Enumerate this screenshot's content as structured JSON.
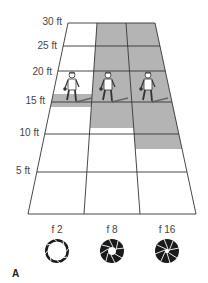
{
  "figure_label": "A",
  "distance_axis": {
    "unit": "ft",
    "labels": [
      "30 ft",
      "25 ft",
      "20 ft",
      "15 ft",
      "10 ft",
      "5 ft"
    ]
  },
  "columns": [
    {
      "aperture": "f 2",
      "focus_distance_ft": 15,
      "depth_of_field_ft": [
        14,
        16
      ],
      "iris": "wide-open"
    },
    {
      "aperture": "f 8",
      "focus_distance_ft": 15,
      "depth_of_field_ft": [
        12,
        30
      ],
      "iris": "medium"
    },
    {
      "aperture": "f 16",
      "focus_distance_ft": 15,
      "depth_of_field_ft": [
        8,
        30
      ],
      "iris": "small"
    }
  ],
  "colors": {
    "grid_line": "#333333",
    "shade": "#b4b4b4",
    "background": "#ffffff",
    "iris": "#1a1a1a"
  }
}
